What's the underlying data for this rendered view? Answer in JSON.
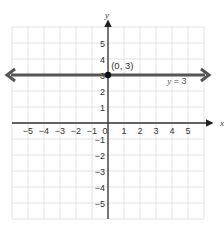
{
  "chart_data": {
    "type": "line",
    "title": "",
    "xlabel": "x",
    "ylabel": "y",
    "xlim": [
      -6,
      6
    ],
    "ylim": [
      -6,
      6
    ],
    "grid": true,
    "x_ticks": [
      "-5",
      "-4",
      "-3",
      "-2",
      "-1",
      "0",
      "1",
      "2",
      "3",
      "4",
      "5"
    ],
    "y_ticks": [
      "5",
      "4",
      "3",
      "2",
      "1",
      "-1",
      "-2",
      "-3",
      "-4",
      "-5"
    ],
    "series": [
      {
        "name": "y = 3",
        "type": "horizontal-line",
        "y": 3,
        "x": [
          -6,
          6
        ],
        "arrows": "both"
      }
    ],
    "points": [
      {
        "x": 0,
        "y": 3,
        "label": "(0, 3)"
      }
    ],
    "annotations": [
      {
        "text": "(0, 3)",
        "x": 0.2,
        "y": 3.4
      },
      {
        "text": "y = 3",
        "x": 3.5,
        "y": 2.6
      }
    ],
    "legend": null
  },
  "labels": {
    "x_axis": "x",
    "y_axis": "y",
    "point_label": "(0, 3)",
    "line_label_var": "y",
    "line_label_rest": " = 3"
  },
  "colors": {
    "grid": "#dddddd",
    "axis": "#333333",
    "line": "#555555",
    "point": "#111111"
  }
}
